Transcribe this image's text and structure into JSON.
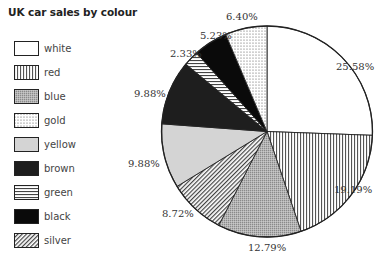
{
  "title": "UK car sales by colour",
  "legend": [
    {
      "label": "white",
      "pattern": "white"
    },
    {
      "label": "red",
      "pattern": "vertical-lines"
    },
    {
      "label": "blue",
      "pattern": "grey-stipple"
    },
    {
      "label": "gold",
      "pattern": "dots"
    },
    {
      "label": "yellow",
      "pattern": "light-grey"
    },
    {
      "label": "brown",
      "pattern": "dark"
    },
    {
      "label": "green",
      "pattern": "horizontal-lines"
    },
    {
      "label": "black",
      "pattern": "black"
    },
    {
      "label": "silver",
      "pattern": "diagonal-lines"
    }
  ],
  "chart_data": {
    "type": "pie",
    "title": "UK car sales by colour",
    "categories": [
      "white",
      "red",
      "blue",
      "silver",
      "yellow",
      "brown",
      "green",
      "black",
      "gold"
    ],
    "values": [
      25.58,
      19.19,
      12.79,
      8.72,
      9.88,
      9.88,
      2.33,
      5.23,
      6.4
    ],
    "labels": [
      "25.58%",
      "19.19%",
      "12.79%",
      "8.72%",
      "9.88%",
      "9.88%",
      "2.33%",
      "5.23%",
      "6.40%"
    ],
    "start_angle": "12 o'clock",
    "direction": "clockwise",
    "legend_position": "left",
    "legend_order": [
      "white",
      "red",
      "blue",
      "gold",
      "yellow",
      "brown",
      "green",
      "black",
      "silver"
    ]
  },
  "colors": {
    "outline": "#222222",
    "white": "#ffffff",
    "light_grey": "#d4d4d4",
    "stipple_grey": "#a8a8a8",
    "dark": "#1e1e1e",
    "black": "#0a0a0a"
  }
}
